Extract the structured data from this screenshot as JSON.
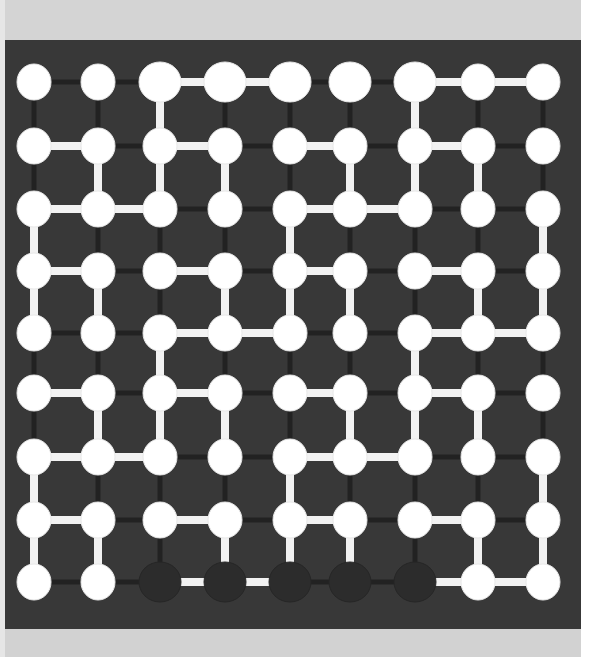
{
  "game": {
    "name": "node-link-puzzle-board",
    "rows": 9,
    "cols": 9,
    "colors": {
      "board": "#383838",
      "groove": "#222222",
      "link": "#f2f2f2",
      "peg_filled": "#ffffff",
      "peg_empty": "#2c2c2c",
      "top_strip": "#d4d4d4",
      "bottom_strip": "#d2d2d2"
    },
    "col_x": [
      29,
      93,
      155,
      220,
      285,
      345,
      410,
      473,
      538
    ],
    "row_y": [
      42,
      106,
      169,
      231,
      293,
      353,
      417,
      480,
      542
    ],
    "empty_nodes": [
      [
        8,
        2
      ],
      [
        8,
        3
      ],
      [
        8,
        4
      ],
      [
        8,
        5
      ],
      [
        8,
        6
      ]
    ],
    "large_nodes": [
      [
        0,
        2
      ],
      [
        0,
        3
      ],
      [
        0,
        4
      ],
      [
        0,
        5
      ],
      [
        0,
        6
      ],
      [
        8,
        2
      ],
      [
        8,
        3
      ],
      [
        8,
        4
      ],
      [
        8,
        5
      ],
      [
        8,
        6
      ]
    ],
    "horizontal_links": [
      [
        0,
        2
      ],
      [
        0,
        3
      ],
      [
        0,
        6
      ],
      [
        0,
        7
      ],
      [
        1,
        0
      ],
      [
        1,
        2
      ],
      [
        1,
        4
      ],
      [
        1,
        6
      ],
      [
        2,
        0
      ],
      [
        2,
        1
      ],
      [
        2,
        4
      ],
      [
        2,
        5
      ],
      [
        3,
        0
      ],
      [
        3,
        2
      ],
      [
        3,
        4
      ],
      [
        3,
        6
      ],
      [
        4,
        2
      ],
      [
        4,
        3
      ],
      [
        4,
        6
      ],
      [
        4,
        7
      ],
      [
        5,
        0
      ],
      [
        5,
        2
      ],
      [
        5,
        4
      ],
      [
        5,
        6
      ],
      [
        6,
        0
      ],
      [
        6,
        1
      ],
      [
        6,
        4
      ],
      [
        6,
        5
      ],
      [
        7,
        0
      ],
      [
        7,
        2
      ],
      [
        7,
        4
      ],
      [
        7,
        6
      ],
      [
        8,
        2
      ],
      [
        8,
        3
      ],
      [
        8,
        6
      ],
      [
        8,
        7
      ]
    ],
    "vertical_links": [
      [
        0,
        2
      ],
      [
        0,
        6
      ],
      [
        1,
        1
      ],
      [
        1,
        2
      ],
      [
        1,
        3
      ],
      [
        1,
        5
      ],
      [
        1,
        6
      ],
      [
        1,
        7
      ],
      [
        2,
        0
      ],
      [
        2,
        4
      ],
      [
        2,
        8
      ],
      [
        3,
        0
      ],
      [
        3,
        1
      ],
      [
        3,
        3
      ],
      [
        3,
        4
      ],
      [
        3,
        5
      ],
      [
        3,
        7
      ],
      [
        3,
        8
      ],
      [
        4,
        2
      ],
      [
        4,
        6
      ],
      [
        5,
        1
      ],
      [
        5,
        2
      ],
      [
        5,
        3
      ],
      [
        5,
        5
      ],
      [
        5,
        6
      ],
      [
        5,
        7
      ],
      [
        6,
        0
      ],
      [
        6,
        4
      ],
      [
        6,
        8
      ],
      [
        7,
        0
      ],
      [
        7,
        1
      ],
      [
        7,
        3
      ],
      [
        7,
        4
      ],
      [
        7,
        5
      ],
      [
        7,
        7
      ],
      [
        7,
        8
      ]
    ]
  }
}
